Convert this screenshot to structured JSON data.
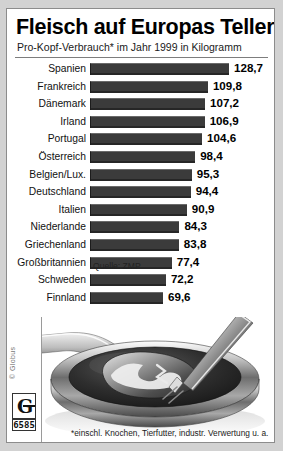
{
  "header": {
    "title": "Fleisch auf Europas Tellern",
    "subtitle": "Pro-Kopf-Verbrauch* im Jahr 1999 in Kilogramm"
  },
  "source_label": "Quelle: ZMP",
  "footnote": "*einschl. Knochen, Tierfutter, industr. Verwertung u. a.",
  "logo": {
    "copyright": "© Globus",
    "mark_letter": "G",
    "number": "6585"
  },
  "illustration": {
    "name": "frying-pan-with-meat-and-fork"
  },
  "colors": {
    "bar": "#3b3b3b",
    "frame": "#8c8c8c",
    "page_background": "#d2d2d2",
    "panel_background": "#ffffff",
    "text": "#000000"
  },
  "chart_data": {
    "type": "bar",
    "orientation": "horizontal",
    "title": "Fleisch auf Europas Tellern",
    "subtitle": "Pro-Kopf-Verbrauch* im Jahr 1999 in Kilogramm",
    "xlabel": "",
    "ylabel": "",
    "unit": "Kilogramm",
    "year": 1999,
    "grid": false,
    "legend": false,
    "xlim": [
      0,
      128.7
    ],
    "value_format": "de-DE (comma decimal)",
    "source": "ZMP",
    "categories": [
      "Spanien",
      "Frankreich",
      "Dänemark",
      "Irland",
      "Portugal",
      "Österreich",
      "Belgien/Lux.",
      "Deutschland",
      "Italien",
      "Niederlande",
      "Griechenland",
      "Großbritannien",
      "Schweden",
      "Finnland"
    ],
    "values": [
      128.7,
      109.8,
      107.2,
      106.9,
      104.6,
      98.4,
      95.3,
      94.4,
      90.9,
      84.3,
      83.8,
      77.4,
      72.2,
      69.6
    ],
    "value_labels": [
      "128,7",
      "109,8",
      "107,2",
      "106,9",
      "104,6",
      "98,4",
      "95,3",
      "94,4",
      "90,9",
      "84,3",
      "83,8",
      "77,4",
      "72,2",
      "69,6"
    ]
  }
}
